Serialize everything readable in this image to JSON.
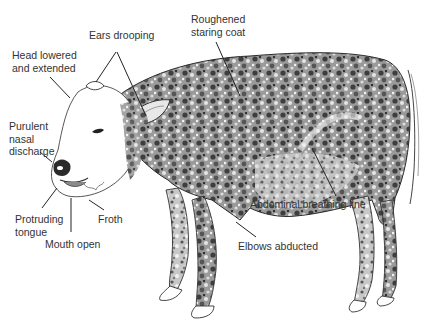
{
  "diagram": {
    "labels": {
      "ears": "Ears drooping",
      "coat": "Roughened\nstaring coat",
      "head": "Head lowered\nand extended",
      "nasal": "Purulent\nnasal\ndischarge",
      "tongue": "Protruding\ntongue",
      "mouth": "Mouth open",
      "froth": "Froth",
      "abdominal": "Abdominal breathing line",
      "elbows": "Elbows abducted"
    },
    "colors": {
      "background": "#ffffff",
      "text": "#333333",
      "leader_line": "#222222",
      "coat_dark": "#3a3a3a",
      "coat_mid": "#7a7a7a",
      "coat_light": "#bdbdbd"
    }
  }
}
